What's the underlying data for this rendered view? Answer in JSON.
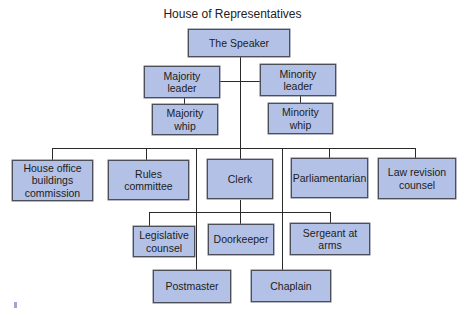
{
  "title": "House of Representatives",
  "colors": {
    "box_fill": "#b4c1e6",
    "box_border": "#4d4f58",
    "line": "#2a2a2a"
  },
  "nodes": {
    "speaker": "The Speaker",
    "majority_leader": "Majority\nleader",
    "majority_whip": "Majority\nwhip",
    "minority_leader": "Minority\nleader",
    "minority_whip": "Minority\nwhip",
    "house_office": "House office\nbuildings\ncommission",
    "rules": "Rules\ncommittee",
    "clerk": "Clerk",
    "parliamentarian": "Parliamentarian",
    "law_revision": "Law revision\ncounsel",
    "legislative": "Legislative\ncounsel",
    "doorkeeper": "Doorkeeper",
    "sergeant": "Sergeant at\narms",
    "postmaster": "Postmaster",
    "chaplain": "Chaplain"
  }
}
